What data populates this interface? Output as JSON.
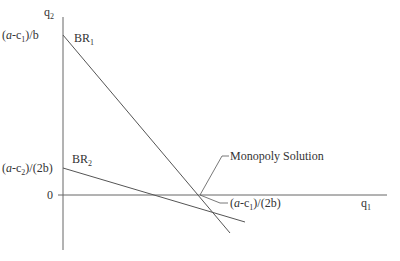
{
  "diagram": {
    "axes": {
      "y_label": "q",
      "y_label_sub": "2",
      "x_label": "q",
      "x_label_sub": "1",
      "zero_label": "0"
    },
    "y_ticks": [
      {
        "text_pre": "(",
        "text_a": "a",
        "text_mid": "-c",
        "text_sub": "1",
        "text_post": ")/b"
      },
      {
        "text_pre": "(",
        "text_a": "a",
        "text_mid": "-c",
        "text_sub": "2",
        "text_post": ")/(2b)"
      }
    ],
    "curves": [
      {
        "name": "BR",
        "sub": "1"
      },
      {
        "name": "BR",
        "sub": "2"
      }
    ],
    "annotations": {
      "monopoly": "Monopoly Solution",
      "x_intercept_pre": "(",
      "x_intercept_a": "a",
      "x_intercept_mid": "-c",
      "x_intercept_sub": "1",
      "x_intercept_post": ")/(2b)"
    },
    "colors": {
      "line": "#555555",
      "text": "#333333"
    }
  }
}
